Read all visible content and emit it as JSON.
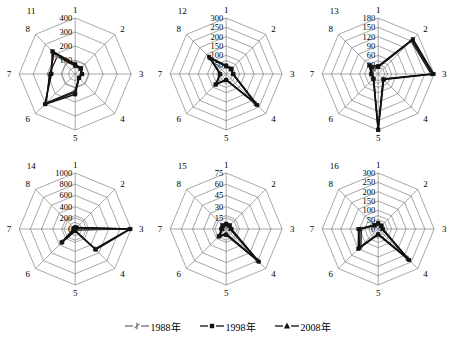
{
  "figure": {
    "title": "",
    "panel_count": 6,
    "axis_count": 8,
    "axis_labels": [
      "1",
      "2",
      "3",
      "4",
      "5",
      "6",
      "7",
      "8"
    ]
  },
  "legend": {
    "position": "bottom-center",
    "items": [
      {
        "label": "1988年",
        "marker": "cross-tick-marker",
        "color": "#6f6f6f"
      },
      {
        "label": "1998年",
        "marker": "square-marker",
        "color": "#111111"
      },
      {
        "label": "2008年",
        "marker": "triangle-marker",
        "color": "#111111"
      }
    ]
  },
  "chart_data": [
    {
      "type": "radar",
      "title": "11",
      "categories": [
        "1",
        "2",
        "3",
        "4",
        "5",
        "6",
        "7",
        "8"
      ],
      "ticks": [
        100,
        200,
        300,
        400
      ],
      "rlim": [
        0,
        400
      ],
      "grid": true,
      "series": [
        {
          "name": "1988年",
          "values": [
            55,
            50,
            45,
            35,
            120,
            290,
            185,
            180
          ]
        },
        {
          "name": "1998年",
          "values": [
            70,
            60,
            50,
            40,
            145,
            305,
            170,
            230
          ]
        },
        {
          "name": "2008年",
          "values": [
            60,
            55,
            48,
            38,
            130,
            300,
            178,
            215
          ]
        }
      ]
    },
    {
      "type": "radar",
      "title": "12",
      "categories": [
        "1",
        "2",
        "3",
        "4",
        "5",
        "6",
        "7",
        "8"
      ],
      "ticks": [
        50,
        100,
        150,
        200,
        250,
        300
      ],
      "rlim": [
        0,
        300
      ],
      "grid": true,
      "series": [
        {
          "name": "1988年",
          "values": [
            40,
            35,
            35,
            215,
            30,
            75,
            30,
            115
          ]
        },
        {
          "name": "1998年",
          "values": [
            45,
            40,
            38,
            235,
            32,
            80,
            33,
            130
          ]
        },
        {
          "name": "2008年",
          "values": [
            42,
            36,
            36,
            225,
            30,
            78,
            31,
            122
          ]
        }
      ]
    },
    {
      "type": "radar",
      "title": "13",
      "categories": [
        "1",
        "2",
        "3",
        "4",
        "5",
        "6",
        "7",
        "8"
      ],
      "ticks": [
        30,
        60,
        90,
        120,
        150,
        180
      ],
      "rlim": [
        0,
        180
      ],
      "grid": true,
      "series": [
        {
          "name": "1988年",
          "values": [
            22,
            150,
            170,
            22,
            175,
            20,
            20,
            20
          ]
        },
        {
          "name": "1998年",
          "values": [
            25,
            158,
            178,
            25,
            180,
            22,
            22,
            40
          ]
        },
        {
          "name": "2008年",
          "values": [
            23,
            154,
            174,
            24,
            178,
            21,
            21,
            30
          ]
        }
      ]
    },
    {
      "type": "radar",
      "title": "14",
      "categories": [
        "1",
        "2",
        "3",
        "4",
        "5",
        "6",
        "7",
        "8"
      ],
      "ticks": [
        0,
        200,
        400,
        600,
        800,
        1000
      ],
      "rlim": [
        0,
        1000
      ],
      "grid": true,
      "series": [
        {
          "name": "1988年",
          "values": [
            20,
            30,
            960,
            30,
            30,
            320,
            20,
            20
          ]
        },
        {
          "name": "1998年",
          "values": [
            25,
            35,
            985,
            520,
            35,
            340,
            25,
            25
          ]
        },
        {
          "name": "2008年",
          "values": [
            22,
            32,
            970,
            500,
            32,
            330,
            22,
            22
          ]
        }
      ]
    },
    {
      "type": "radar",
      "title": "15",
      "categories": [
        "1",
        "2",
        "3",
        "4",
        "5",
        "6",
        "7",
        "8"
      ],
      "ticks": [
        0,
        15,
        30,
        45,
        60,
        75
      ],
      "rlim": [
        0,
        75
      ],
      "grid": true,
      "series": [
        {
          "name": "1988年",
          "values": [
            5,
            5,
            5,
            58,
            6,
            12,
            5,
            5
          ]
        },
        {
          "name": "1998年",
          "values": [
            7,
            7,
            7,
            62,
            8,
            14,
            6,
            7
          ]
        },
        {
          "name": "2008年",
          "values": [
            6,
            6,
            6,
            60,
            7,
            13,
            5,
            6
          ]
        }
      ]
    },
    {
      "type": "radar",
      "title": "16",
      "categories": [
        "1",
        "2",
        "3",
        "4",
        "5",
        "6",
        "7",
        "8"
      ],
      "ticks": [
        0,
        50,
        100,
        150,
        200,
        250,
        300
      ],
      "rlim": [
        0,
        300
      ],
      "grid": true,
      "series": [
        {
          "name": "1988年",
          "values": [
            25,
            20,
            20,
            215,
            25,
            130,
            90,
            25
          ]
        },
        {
          "name": "1998年",
          "values": [
            32,
            25,
            25,
            235,
            30,
            150,
            105,
            30
          ]
        },
        {
          "name": "2008年",
          "values": [
            28,
            22,
            22,
            225,
            27,
            140,
            98,
            27
          ]
        }
      ]
    }
  ]
}
